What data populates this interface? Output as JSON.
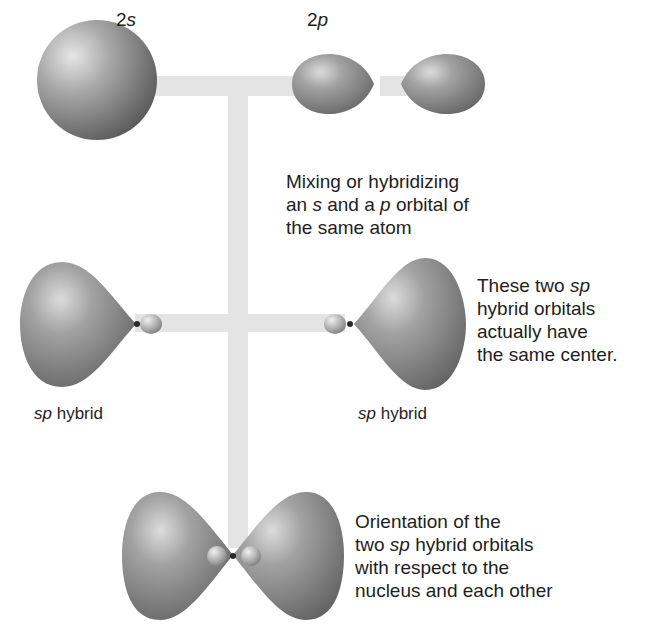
{
  "diagram": {
    "title_labels": {
      "orbital_2s": {
        "num": "2",
        "letter": "s"
      },
      "orbital_2p": {
        "num": "2",
        "letter": "p"
      }
    },
    "captions": {
      "mixing": {
        "line1": "Mixing or hybridizing",
        "line2_pre": "an ",
        "line2_s": "s",
        "line2_mid": " and a ",
        "line2_p": "p",
        "line2_post": " orbital of",
        "line3": "the same atom"
      },
      "same_center": {
        "line1_pre": "These two ",
        "line1_sp": "sp",
        "line2": "hybrid orbitals",
        "line3": "actually have",
        "line4": "the same center."
      },
      "orientation": {
        "line1": "Orientation of the",
        "line2_pre": "two ",
        "line2_sp": "sp",
        "line2_post": " hybrid orbitals",
        "line3": "with respect to the",
        "line4": "nucleus and each other"
      }
    },
    "hybrid_labels": {
      "left": {
        "sp": "sp",
        "rest": " hybrid"
      },
      "right": {
        "sp": "sp",
        "rest": " hybrid"
      }
    },
    "colors": {
      "connector": "#e4e4e4",
      "orbital_dark": "#5e5e5e",
      "orbital_mid": "#8a8a8a",
      "orbital_light": "#d8d8d8",
      "nucleus": "#2a2a2a"
    }
  }
}
